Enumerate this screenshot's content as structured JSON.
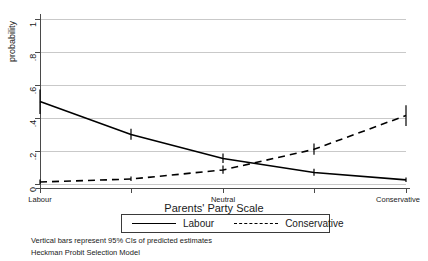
{
  "chart_data": {
    "type": "line",
    "title": "",
    "xlabel": "Parents' Party Scale",
    "ylabel": "probability",
    "ylim": [
      0,
      1
    ],
    "yticks": [
      0,
      0.2,
      0.4,
      0.6,
      0.8,
      1
    ],
    "ytick_labels": [
      "0",
      ".2",
      ".4",
      ".6",
      ".8",
      "1"
    ],
    "x": [
      1,
      2,
      3,
      4,
      5
    ],
    "xtick_labels": [
      "Labour",
      "",
      "Neutral",
      "",
      "Conservative"
    ],
    "grid": "horizontal",
    "legend_position": "below-axis",
    "series": [
      {
        "name": "Labour",
        "style": "solid",
        "color": "#000000",
        "values": [
          0.5,
          0.3,
          0.155,
          0.07,
          0.025
        ],
        "ci_lower": [
          0.425,
          0.268,
          0.128,
          0.05,
          0.012
        ],
        "ci_upper": [
          0.572,
          0.335,
          0.185,
          0.092,
          0.04
        ]
      },
      {
        "name": "Conservative",
        "style": "dashed",
        "color": "#000000",
        "values": [
          0.012,
          0.03,
          0.085,
          0.21,
          0.415
        ],
        "ci_lower": [
          0.0,
          0.018,
          0.062,
          0.178,
          0.352
        ],
        "ci_upper": [
          0.028,
          0.045,
          0.112,
          0.245,
          0.478
        ]
      }
    ],
    "annotations": [
      "Vertical bars represent 95% CIs of predicted estimates",
      "Heckman Probit Selection Model"
    ]
  },
  "legend": {
    "entries": [
      {
        "label": "Labour"
      },
      {
        "label": "Conservative"
      }
    ]
  },
  "notes": {
    "line1": "Vertical bars represent 95% CIs of predicted estimates",
    "line2": "Heckman Probit Selection Model"
  }
}
